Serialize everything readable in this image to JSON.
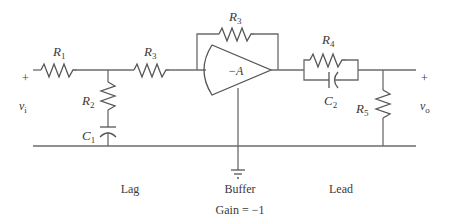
{
  "diagram": {
    "input": {
      "plus": "+",
      "voltage_main": "v",
      "voltage_sub": "i"
    },
    "output": {
      "plus": "+",
      "voltage_main": "v",
      "voltage_sub": "o"
    },
    "components": {
      "R1": {
        "main": "R",
        "sub": "1"
      },
      "R2": {
        "main": "R",
        "sub": "2"
      },
      "C1": {
        "main": "C",
        "sub": "1"
      },
      "R3_in": {
        "main": "R",
        "sub": "3"
      },
      "R3_fb": {
        "main": "R",
        "sub": "3"
      },
      "amp": {
        "label": "−A"
      },
      "R4": {
        "main": "R",
        "sub": "4"
      },
      "C2": {
        "main": "C",
        "sub": "2"
      },
      "R5": {
        "main": "R",
        "sub": "5"
      }
    },
    "sections": {
      "lag": "Lag",
      "buffer": "Buffer",
      "buffer_gain": "Gain = −1",
      "lead": "Lead"
    },
    "colors": {
      "line": "#6b6b6b",
      "text": "#3a3a3a",
      "background": "#ffffff"
    }
  }
}
